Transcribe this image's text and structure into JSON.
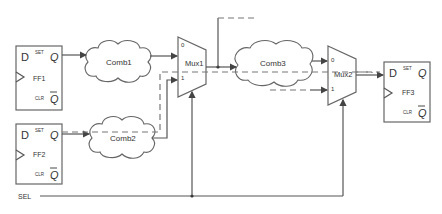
{
  "diagram": {
    "title": "",
    "flipflops": [
      {
        "id": "ff1",
        "name": "FF1",
        "d": "D",
        "set": "SET",
        "q": "Q",
        "clr": "CLR",
        "qbar": "Q"
      },
      {
        "id": "ff2",
        "name": "FF2",
        "d": "D",
        "set": "SET",
        "q": "Q",
        "clr": "CLR",
        "qbar": "Q"
      },
      {
        "id": "ff3",
        "name": "FF3",
        "d": "D",
        "set": "SET",
        "q": "Q",
        "clr": "CLR",
        "qbar": "Q"
      }
    ],
    "combs": [
      {
        "id": "comb1",
        "name": "Comb1"
      },
      {
        "id": "comb2",
        "name": "Comb2"
      },
      {
        "id": "comb3",
        "name": "Comb3"
      }
    ],
    "muxes": [
      {
        "id": "mux1",
        "name": "Mux1",
        "in0": "0",
        "in1": "1"
      },
      {
        "id": "mux2",
        "name": "Mux2",
        "in0": "0",
        "in1": "1"
      }
    ],
    "signals": {
      "sel": "SEL"
    },
    "colors": {
      "line": "#555555",
      "dashed": "#777777",
      "text": "#333333"
    }
  }
}
